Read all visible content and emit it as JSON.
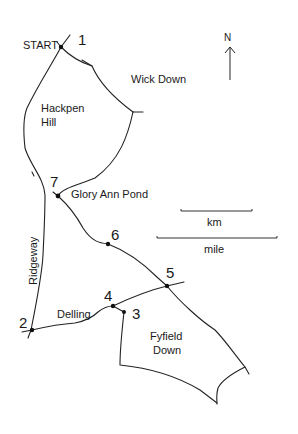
{
  "map": {
    "start_label": "START",
    "north_label": "N",
    "waypoints": [
      {
        "id": "1",
        "label": "1"
      },
      {
        "id": "2",
        "label": "2"
      },
      {
        "id": "3",
        "label": "3"
      },
      {
        "id": "4",
        "label": "4"
      },
      {
        "id": "5",
        "label": "5"
      },
      {
        "id": "6",
        "label": "6"
      },
      {
        "id": "7",
        "label": "7"
      }
    ],
    "places": {
      "wick_down": "Wick Down",
      "hackpen_line1": "Hackpen",
      "hackpen_line2": "Hill",
      "glory_ann_pond": "Glory Ann Pond",
      "ridgeway": "Ridgeway",
      "delling": "Delling",
      "fyfield_line1": "Fyfield",
      "fyfield_line2": "Down"
    },
    "scale": {
      "km_label": "km",
      "mile_label": "mile"
    }
  }
}
